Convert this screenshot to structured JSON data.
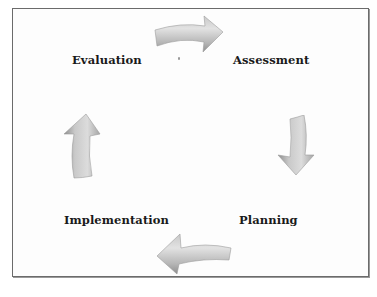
{
  "diagram": {
    "type": "cycle",
    "direction": "clockwise",
    "steps": [
      {
        "label": "Assessment",
        "position": "top-right"
      },
      {
        "label": "Planning",
        "position": "bottom-right"
      },
      {
        "label": "Implementation",
        "position": "bottom-left"
      },
      {
        "label": "Evaluation",
        "position": "top-left"
      }
    ],
    "arrows": [
      {
        "from": "Evaluation",
        "to": "Assessment",
        "direction": "right"
      },
      {
        "from": "Assessment",
        "to": "Planning",
        "direction": "down"
      },
      {
        "from": "Planning",
        "to": "Implementation",
        "direction": "left"
      },
      {
        "from": "Implementation",
        "to": "Evaluation",
        "direction": "up"
      }
    ],
    "colors": {
      "arrow_fill_light": "#d8d8d8",
      "arrow_fill_dark": "#9e9e9e",
      "border": "#6b6b6b",
      "text": "#1a1a1a",
      "background": "#ffffff"
    }
  }
}
